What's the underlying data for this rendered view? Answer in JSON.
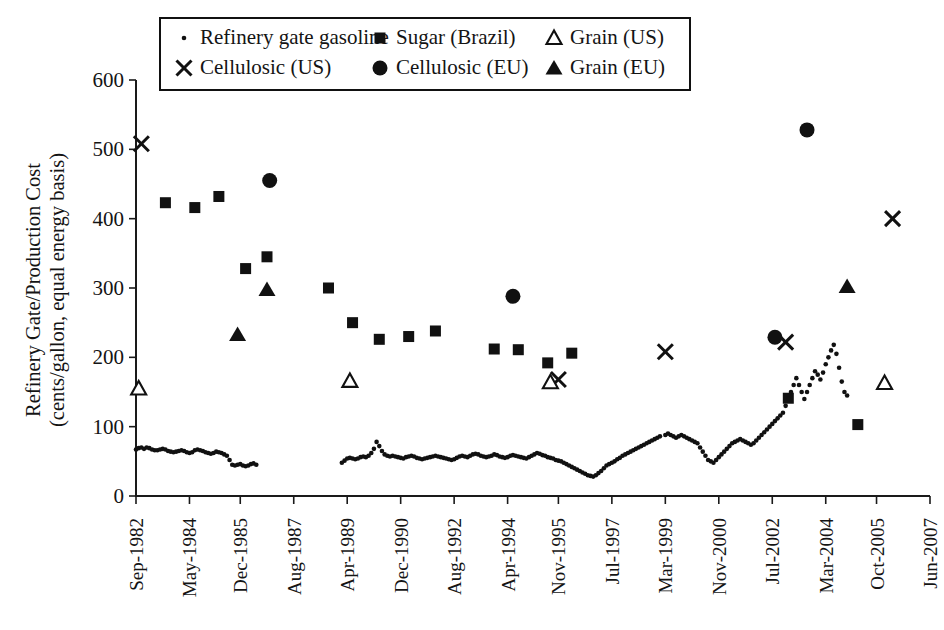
{
  "figure": {
    "background": "#ffffff",
    "foreground": "#111111"
  },
  "axes": {
    "y_title_line1": "Refinery Gate/Production Cost",
    "y_title_line2": "(cents/gallon, equal energy basis)",
    "y_ticks": [
      0,
      100,
      200,
      300,
      400,
      500,
      600
    ],
    "y_min": 0,
    "y_max": 600,
    "x_ticks": [
      "Sep-1982",
      "May-1984",
      "Dec-1985",
      "Aug-1987",
      "Apr-1989",
      "Dec-1990",
      "Aug-1992",
      "Apr-1994",
      "Nov-1995",
      "Jul-1997",
      "Mar-1999",
      "Nov-2000",
      "Jul-2002",
      "Mar-2004",
      "Oct-2005",
      "Jun-2007"
    ],
    "x_label": ""
  },
  "legend": {
    "position": "top-center",
    "entries": [
      {
        "label": "Refinery gate gasoline",
        "marker": "small-dot"
      },
      {
        "label": "Sugar (Brazil)",
        "marker": "filled-square"
      },
      {
        "label": "Grain (US)",
        "marker": "open-triangle"
      },
      {
        "label": "Cellulosic (US)",
        "marker": "cross-x"
      },
      {
        "label": "Cellulosic (EU)",
        "marker": "filled-circle"
      },
      {
        "label": "Grain (EU)",
        "marker": "filled-triangle"
      }
    ]
  },
  "chart_data": {
    "type": "scatter",
    "title": "",
    "xlabel": "",
    "ylabel": "Refinery Gate/Production Cost (cents/gallon, equal energy basis)",
    "ylim": [
      0,
      600
    ],
    "xlim": [
      "Sep-1982",
      "Jun-2007"
    ],
    "grid": false,
    "x_tick_labels": [
      "Sep-1982",
      "May-1984",
      "Dec-1985",
      "Aug-1987",
      "Apr-1989",
      "Dec-1990",
      "Aug-1992",
      "Apr-1994",
      "Nov-1995",
      "Jul-1997",
      "Mar-1999",
      "Nov-2000",
      "Jul-2002",
      "Mar-2004",
      "Oct-2005",
      "Jun-2007"
    ],
    "y_tick_labels": [
      "0",
      "100",
      "200",
      "300",
      "400",
      "500",
      "600"
    ],
    "series": [
      {
        "name": "Cellulosic (US)",
        "marker": "cross-x",
        "points": [
          {
            "x": "Nov-1982",
            "y": 508
          },
          {
            "x": "Nov-1995",
            "y": 168
          },
          {
            "x": "Mar-1999",
            "y": 208
          },
          {
            "x": "Dec-2002",
            "y": 222
          },
          {
            "x": "Apr-2006",
            "y": 400
          }
        ]
      },
      {
        "name": "Sugar (Brazil)",
        "marker": "filled-square",
        "points": [
          {
            "x": "Aug-1983",
            "y": 423
          },
          {
            "x": "Jul-1984",
            "y": 416
          },
          {
            "x": "Apr-1985",
            "y": 432
          },
          {
            "x": "Feb-1986",
            "y": 328
          },
          {
            "x": "Oct-1986",
            "y": 345
          },
          {
            "x": "Sep-1988",
            "y": 300
          },
          {
            "x": "Jun-1989",
            "y": 250
          },
          {
            "x": "Apr-1990",
            "y": 226
          },
          {
            "x": "Mar-1991",
            "y": 230
          },
          {
            "x": "Jan-1992",
            "y": 238
          },
          {
            "x": "Nov-1993",
            "y": 212
          },
          {
            "x": "Aug-1994",
            "y": 211
          },
          {
            "x": "Jul-1995",
            "y": 192
          },
          {
            "x": "Apr-1996",
            "y": 206
          },
          {
            "x": "Jan-2003",
            "y": 141
          },
          {
            "x": "Mar-2005",
            "y": 103
          }
        ]
      },
      {
        "name": "Grain (US)",
        "marker": "open-triangle",
        "points": [
          {
            "x": "Oct-1982",
            "y": 155
          },
          {
            "x": "May-1989",
            "y": 166
          },
          {
            "x": "Aug-1995",
            "y": 164
          },
          {
            "x": "Jan-2006",
            "y": 163
          }
        ]
      },
      {
        "name": "Cellulosic (EU)",
        "marker": "filled-circle",
        "points": [
          {
            "x": "Nov-1986",
            "y": 455
          },
          {
            "x": "Jun-1994",
            "y": 288
          },
          {
            "x": "Aug-2002",
            "y": 229
          },
          {
            "x": "Aug-2003",
            "y": 528
          }
        ]
      },
      {
        "name": "Grain (EU)",
        "marker": "filled-triangle",
        "points": [
          {
            "x": "Nov-1985",
            "y": 233
          },
          {
            "x": "Oct-1986",
            "y": 298
          },
          {
            "x": "Nov-2004",
            "y": 302
          }
        ]
      },
      {
        "name": "Refinery gate gasoline",
        "marker": "small-dot",
        "note": "Monthly series, two gaps in record",
        "segments": [
          {
            "from": "Sep-1982",
            "to": "Jan-1986",
            "values": [
              67,
              69,
              70,
              68,
              70,
              69,
              67,
              66,
              66,
              67,
              68,
              67,
              65,
              64,
              63,
              64,
              65,
              66,
              65,
              63,
              62,
              63,
              66,
              67,
              66,
              65,
              63,
              62,
              61,
              62,
              64,
              63,
              62,
              60,
              58,
              52,
              45,
              44,
              45,
              46,
              44,
              43,
              44,
              46,
              47,
              45
            ]
          },
          {
            "from": "Feb-1989",
            "to": "Feb-1999",
            "values": [
              48,
              51,
              54,
              55,
              54,
              53,
              54,
              56,
              57,
              56,
              58,
              62,
              68,
              78,
              72,
              65,
              60,
              58,
              57,
              58,
              57,
              56,
              55,
              54,
              56,
              57,
              58,
              57,
              55,
              54,
              53,
              54,
              55,
              56,
              57,
              58,
              57,
              56,
              55,
              54,
              53,
              52,
              53,
              55,
              57,
              58,
              57,
              56,
              58,
              60,
              61,
              60,
              58,
              57,
              56,
              57,
              58,
              60,
              59,
              57,
              56,
              55,
              56,
              58,
              59,
              58,
              57,
              56,
              55,
              54,
              56,
              58,
              60,
              62,
              61,
              59,
              58,
              56,
              55,
              54,
              52,
              51,
              50,
              48,
              46,
              44,
              42,
              40,
              38,
              36,
              34,
              32,
              30,
              29,
              28,
              30,
              33,
              36,
              40,
              44,
              46,
              48,
              50,
              53,
              55,
              58,
              60,
              62,
              64,
              66,
              68,
              70,
              72,
              74,
              76,
              78,
              80,
              82,
              84,
              86
            ]
          },
          {
            "from": "Mar-1999",
            "to": "Jun-2007",
            "values": [
              88,
              90,
              88,
              86,
              84,
              86,
              88,
              86,
              84,
              82,
              80,
              78,
              76,
              70,
              64,
              58,
              52,
              50,
              48,
              52,
              56,
              60,
              64,
              68,
              72,
              76,
              78,
              80,
              82,
              80,
              78,
              76,
              74,
              76,
              80,
              84,
              88,
              92,
              96,
              100,
              104,
              108,
              112,
              116,
              120,
              130,
              140,
              150,
              160,
              170,
              160,
              150,
              140,
              150,
              160,
              170,
              180,
              175,
              168,
              178,
              190,
              200,
              210,
              218,
              205,
              185,
              165,
              150,
              145
            ]
          }
        ]
      }
    ]
  }
}
